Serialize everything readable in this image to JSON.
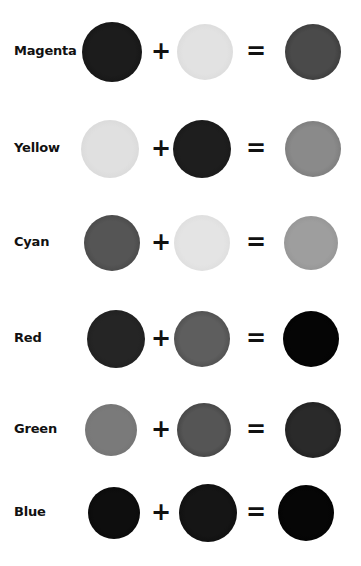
{
  "operators": {
    "plus": "+",
    "equals": "="
  },
  "rows": [
    {
      "label": "Magenta",
      "top": 17,
      "a": {
        "cx": 112,
        "r": 30,
        "fill": "#1c1c1c",
        "edge": "#0e0e0e"
      },
      "b": {
        "cx": 205,
        "r": 28,
        "fill": "#e2e2e2",
        "edge": "#d4d4d4"
      },
      "c": {
        "cx": 313,
        "r": 28,
        "fill": "#4a4a4a",
        "edge": "#2a2a2a"
      }
    },
    {
      "label": "Yellow",
      "top": 114,
      "a": {
        "cx": 110,
        "r": 29,
        "fill": "#e0e0e0",
        "edge": "#d2d2d2"
      },
      "b": {
        "cx": 202,
        "r": 29,
        "fill": "#1e1e1e",
        "edge": "#141414"
      },
      "c": {
        "cx": 313,
        "r": 28,
        "fill": "#8a8a8a",
        "edge": "#6a6a6a"
      }
    },
    {
      "label": "Cyan",
      "top": 208,
      "a": {
        "cx": 112,
        "r": 28,
        "fill": "#555555",
        "edge": "#3a3a3a"
      },
      "b": {
        "cx": 202,
        "r": 28,
        "fill": "#e4e4e4",
        "edge": "#d6d6d6"
      },
      "c": {
        "cx": 311,
        "r": 27,
        "fill": "#9e9e9e",
        "edge": "#8a8a8a"
      }
    },
    {
      "label": "Red",
      "top": 304,
      "a": {
        "cx": 116,
        "r": 29,
        "fill": "#252525",
        "edge": "#1a1a1a"
      },
      "b": {
        "cx": 202,
        "r": 28,
        "fill": "#5e5e5e",
        "edge": "#3c3c3c"
      },
      "c": {
        "cx": 311,
        "r": 28,
        "fill": "#050505",
        "edge": "#000000"
      }
    },
    {
      "label": "Green",
      "top": 395,
      "a": {
        "cx": 111,
        "r": 26,
        "fill": "#7a7a7a",
        "edge": "#6e6e6e"
      },
      "b": {
        "cx": 204,
        "r": 27,
        "fill": "#555555",
        "edge": "#2e2e2e"
      },
      "c": {
        "cx": 313,
        "r": 28,
        "fill": "#2a2a2a",
        "edge": "#141414"
      }
    },
    {
      "label": "Blue",
      "top": 478,
      "a": {
        "cx": 114,
        "r": 26,
        "fill": "#0e0e0e",
        "edge": "#050505"
      },
      "b": {
        "cx": 208,
        "r": 29,
        "fill": "#151515",
        "edge": "#080808"
      },
      "c": {
        "cx": 306,
        "r": 28,
        "fill": "#060606",
        "edge": "#000000"
      }
    }
  ]
}
